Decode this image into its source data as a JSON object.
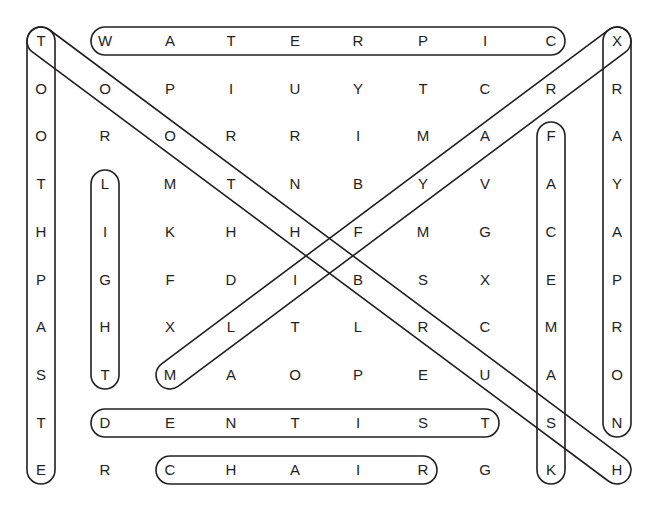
{
  "puzzle": {
    "type": "word-search",
    "grid": [
      [
        "T",
        "W",
        "A",
        "T",
        "E",
        "R",
        "P",
        "I",
        "C",
        "X"
      ],
      [
        "O",
        "O",
        "P",
        "I",
        "U",
        "Y",
        "T",
        "C",
        "R",
        "R"
      ],
      [
        "O",
        "R",
        "O",
        "R",
        "R",
        "I",
        "M",
        "A",
        "F",
        "A"
      ],
      [
        "T",
        "L",
        "M",
        "T",
        "N",
        "B",
        "Y",
        "V",
        "A",
        "Y"
      ],
      [
        "H",
        "I",
        "K",
        "H",
        "H",
        "F",
        "M",
        "G",
        "C",
        "A"
      ],
      [
        "P",
        "G",
        "F",
        "D",
        "I",
        "B",
        "S",
        "X",
        "E",
        "P"
      ],
      [
        "A",
        "H",
        "X",
        "L",
        "T",
        "L",
        "R",
        "C",
        "M",
        "R"
      ],
      [
        "S",
        "T",
        "M",
        "A",
        "O",
        "P",
        "E",
        "U",
        "A",
        "O"
      ],
      [
        "T",
        "D",
        "E",
        "N",
        "T",
        "I",
        "S",
        "T",
        "S",
        "N"
      ],
      [
        "E",
        "R",
        "C",
        "H",
        "A",
        "I",
        "R",
        "G",
        "K",
        "H"
      ]
    ],
    "col_x": [
      41,
      105,
      170,
      231,
      295,
      358,
      423,
      485,
      551,
      617
    ],
    "row_y": [
      41,
      89,
      136,
      184,
      232,
      280,
      327,
      375,
      423,
      470
    ],
    "found_words": [
      {
        "word": "WATERPIC",
        "start": [
          0,
          1
        ],
        "end": [
          0,
          8
        ],
        "direction": "horizontal"
      },
      {
        "word": "DENTIST",
        "start": [
          8,
          1
        ],
        "end": [
          8,
          7
        ],
        "direction": "horizontal"
      },
      {
        "word": "CHAIR",
        "start": [
          9,
          2
        ],
        "end": [
          9,
          6
        ],
        "direction": "horizontal"
      },
      {
        "word": "TOOTHPASTE",
        "start": [
          0,
          0
        ],
        "end": [
          9,
          0
        ],
        "direction": "vertical"
      },
      {
        "word": "LIGHT",
        "start": [
          3,
          1
        ],
        "end": [
          7,
          1
        ],
        "direction": "vertical"
      },
      {
        "word": "FACEMASK",
        "start": [
          2,
          8
        ],
        "end": [
          9,
          8
        ],
        "direction": "vertical"
      },
      {
        "word": "XRAYAPRON",
        "start": [
          0,
          9
        ],
        "end": [
          8,
          9
        ],
        "direction": "vertical"
      },
      {
        "word": "TOOTHBRUSH",
        "start": [
          0,
          0
        ],
        "end": [
          9,
          9
        ],
        "direction": "diagonal-down-right"
      },
      {
        "word": "XRAYFILM",
        "start": [
          0,
          9
        ],
        "end": [
          7,
          2
        ],
        "direction": "diagonal-down-left"
      }
    ],
    "outline_color": "#231f20",
    "letter_color": "#231f20"
  }
}
